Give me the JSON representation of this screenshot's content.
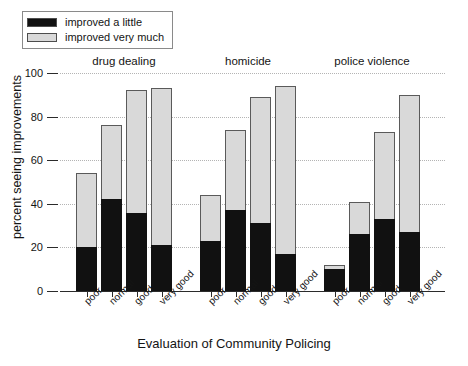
{
  "chart_data": {
    "type": "bar",
    "subtype": "stacked-grouped-bar",
    "title": "",
    "xlabel": "Evaluation of Community Policing",
    "ylabel": "percent seeing improvements",
    "ylim": [
      0,
      100
    ],
    "yticks": [
      0,
      20,
      40,
      60,
      80,
      100
    ],
    "ytick_labels": [
      "0",
      "20",
      "40",
      "60",
      "80",
      "100"
    ],
    "grid": "horizontal-dotted",
    "legend_position": "top-left",
    "categories": [
      "poor",
      "normal",
      "good",
      "very good"
    ],
    "groups": [
      "drug dealing",
      "homicide",
      "police violence"
    ],
    "series": [
      {
        "name": "improved a little",
        "color": "#111111",
        "values_by_group": {
          "drug dealing": [
            20,
            42,
            36,
            21
          ],
          "homicide": [
            23,
            37,
            31,
            17
          ],
          "police violence": [
            10,
            26,
            33,
            27
          ]
        }
      },
      {
        "name": "improved very much",
        "color": "#d9d9d9",
        "values_by_group": {
          "drug dealing": [
            34,
            34,
            56,
            72
          ],
          "homicide": [
            21,
            37,
            58,
            77
          ],
          "police violence": [
            2,
            15,
            40,
            63
          ]
        }
      }
    ],
    "totals_by_group": {
      "drug dealing": [
        54,
        76,
        92,
        93
      ],
      "homicide": [
        44,
        74,
        89,
        94
      ],
      "police violence": [
        12,
        41,
        73,
        90
      ]
    }
  },
  "legend": {
    "items": [
      {
        "label": "improved a little",
        "color": "#111111"
      },
      {
        "label": "improved very much",
        "color": "#d9d9d9"
      }
    ]
  },
  "axes": {
    "x_title": "Evaluation of Community Policing",
    "y_title": "percent seeing improvements",
    "y_ticks": [
      "100",
      "80",
      "60",
      "40",
      "20",
      "0"
    ]
  },
  "group_titles": [
    "drug dealing",
    "homicide",
    "police violence"
  ],
  "x_labels": [
    "poor",
    "normal",
    "good",
    "very good",
    "poor",
    "normal",
    "good",
    "very good",
    "poor",
    "normal",
    "good",
    "very good"
  ]
}
